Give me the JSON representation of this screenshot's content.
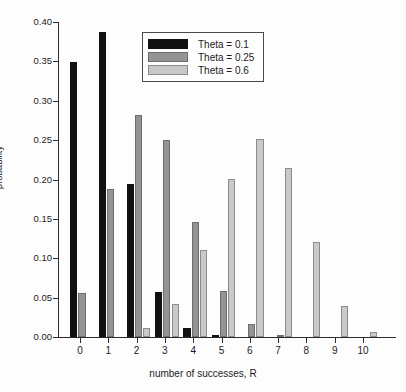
{
  "chart_data": {
    "type": "bar",
    "title": "",
    "xlabel": "number of successes, R",
    "ylabel": "probability",
    "categories": [
      "0",
      "1",
      "2",
      "3",
      "4",
      "5",
      "6",
      "7",
      "8",
      "9",
      "10"
    ],
    "series": [
      {
        "name": "Theta = 0.1",
        "color": "#111111",
        "values": [
          0.349,
          0.387,
          0.194,
          0.057,
          0.011,
          0.001,
          0.0,
          0.0,
          0.0,
          0.0,
          0.0
        ]
      },
      {
        "name": "Theta = 0.25",
        "color": "#949494",
        "values": [
          0.056,
          0.188,
          0.282,
          0.25,
          0.146,
          0.058,
          0.016,
          0.003,
          0.0,
          0.0,
          0.0
        ]
      },
      {
        "name": "Theta = 0.6",
        "color": "#c9c9c9",
        "values": [
          0.0,
          0.0,
          0.011,
          0.042,
          0.111,
          0.201,
          0.251,
          0.215,
          0.121,
          0.04,
          0.006
        ]
      }
    ],
    "ylim": [
      0.0,
      0.4
    ],
    "yticks": [
      "0.00",
      "0.05",
      "0.10",
      "0.15",
      "0.20",
      "0.25",
      "0.30",
      "0.35",
      "0.40"
    ],
    "ytick_values": [
      0.0,
      0.05,
      0.1,
      0.15,
      0.2,
      0.25,
      0.3,
      0.35,
      0.4
    ],
    "grid": false,
    "legend_position": "top-center"
  },
  "legend": {
    "entries": [
      {
        "label": "Theta = 0.1"
      },
      {
        "label": "Theta = 0.25"
      },
      {
        "label": "Theta = 0.6"
      }
    ]
  },
  "axes": {
    "x_title": "number of successes, R",
    "y_title": "probability"
  }
}
